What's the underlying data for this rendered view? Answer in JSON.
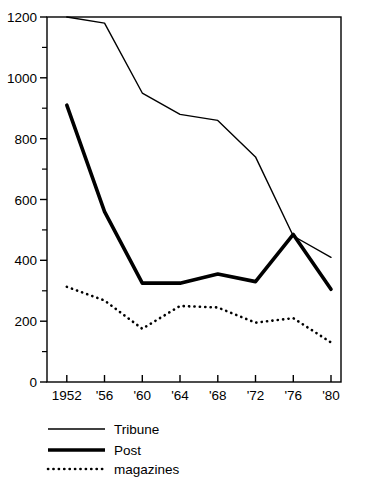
{
  "chart_data": {
    "type": "line",
    "title": "",
    "xlabel": "",
    "ylabel": "",
    "x": [
      1952,
      1956,
      1960,
      1964,
      1968,
      1972,
      1976,
      1980
    ],
    "categories": [
      "1952",
      "'56",
      "'60",
      "'64",
      "'68",
      "'72",
      "'76",
      "'80"
    ],
    "series": [
      {
        "name": "Tribune",
        "style": "thin-solid",
        "values": [
          1200,
          1180,
          950,
          880,
          860,
          740,
          480,
          410
        ]
      },
      {
        "name": "Post",
        "style": "thick-solid",
        "values": [
          910,
          560,
          325,
          325,
          355,
          330,
          485,
          305
        ]
      },
      {
        "name": "magazines",
        "style": "dotted",
        "values": [
          313,
          268,
          175,
          250,
          245,
          195,
          210,
          130
        ]
      }
    ],
    "ylim": [
      0,
      1200
    ],
    "ytick_labels": [
      "0",
      "200",
      "400",
      "600",
      "800",
      "1000",
      "1200"
    ],
    "ytick_values": [
      0,
      200,
      400,
      600,
      800,
      1000,
      1200
    ],
    "yminor_values": [
      100,
      300,
      500,
      700,
      900,
      1100
    ],
    "grid": false,
    "legend_position": "below-axes",
    "legend": [
      {
        "label": "Tribune",
        "style": "thin-solid"
      },
      {
        "label": "Post",
        "style": "thick-solid"
      },
      {
        "label": "magazines",
        "style": "dotted"
      }
    ]
  },
  "axes": {
    "y_labels": {
      "t0": "0",
      "t200": "200",
      "t400": "400",
      "t600": "600",
      "t800": "800",
      "t1000": "1000",
      "t1200": "1200"
    },
    "x_labels": {
      "x1952": "1952",
      "x1956": "'56",
      "x1960": "'60",
      "x1964": "'64",
      "x1968": "'68",
      "x1972": "'72",
      "x1976": "'76",
      "x1980": "'80"
    }
  },
  "legend": {
    "tribune_label": "Tribune",
    "post_label": "Post",
    "magazines_label": "magazines"
  },
  "colors": {
    "line": "#000000",
    "background": "#ffffff",
    "text": "#000000"
  }
}
